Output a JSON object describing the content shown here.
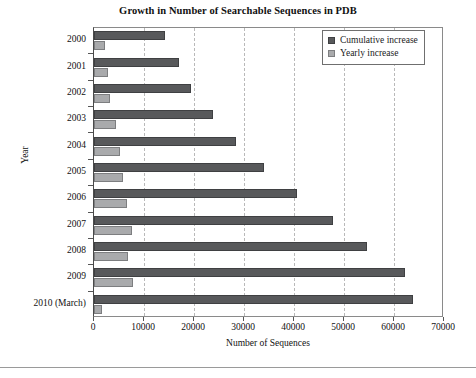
{
  "chart_data": {
    "type": "bar",
    "orientation": "horizontal",
    "title": "Growth in Number of Searchable Sequences in PDB",
    "xlabel": "Number of Sequences",
    "ylabel": "Year",
    "categories": [
      "2000",
      "2001",
      "2002",
      "2003",
      "2004",
      "2005",
      "2006",
      "2007",
      "2008",
      "2009",
      "2010 (March)"
    ],
    "series": [
      {
        "name": "Cumulative increase",
        "color": "#58595b",
        "values": [
          14200,
          17000,
          19400,
          23800,
          28400,
          34000,
          40600,
          47700,
          54500,
          62100,
          63800
        ]
      },
      {
        "name": "Yearly increase",
        "color": "#a9aaac",
        "values": [
          2200,
          2800,
          3100,
          4400,
          5200,
          5800,
          6600,
          7600,
          6800,
          7700,
          1500
        ]
      }
    ],
    "xlim": [
      0,
      70000
    ],
    "xticks": [
      0,
      10000,
      20000,
      30000,
      40000,
      50000,
      60000,
      70000
    ],
    "xtick_labels": [
      "0",
      "10000",
      "20000",
      "30000",
      "40000",
      "50000",
      "60000",
      "70000"
    ],
    "grid": "vertical-dashed",
    "legend_position": "top-right",
    "legend_entries": [
      "Cumulative increase",
      "Yearly increase"
    ]
  }
}
